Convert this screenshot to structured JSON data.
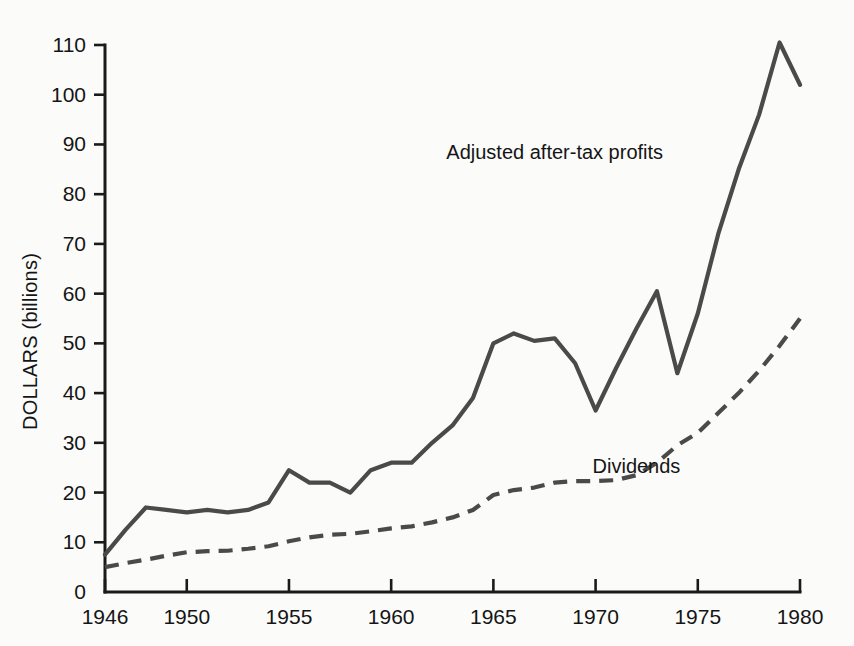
{
  "chart_data": {
    "type": "line",
    "title": "",
    "xlabel": "",
    "ylabel": "DOLLARS (billions)",
    "xlim": [
      1946,
      1980
    ],
    "ylim": [
      0,
      110
    ],
    "grid": false,
    "legend_position": "inline-annotations",
    "x_ticks": [
      "1946",
      "1950",
      "1955",
      "1960",
      "1965",
      "1970",
      "1975",
      "1980"
    ],
    "x_tick_values": [
      1946,
      1950,
      1955,
      1960,
      1965,
      1970,
      1975,
      1980
    ],
    "y_ticks": [
      "0",
      "10",
      "20",
      "30",
      "40",
      "50",
      "60",
      "70",
      "80",
      "90",
      "100",
      "110"
    ],
    "y_tick_values": [
      0,
      10,
      20,
      30,
      40,
      50,
      60,
      70,
      80,
      90,
      100,
      110
    ],
    "x": [
      1946,
      1947,
      1948,
      1949,
      1950,
      1951,
      1952,
      1953,
      1954,
      1955,
      1956,
      1957,
      1958,
      1959,
      1960,
      1961,
      1962,
      1963,
      1964,
      1965,
      1966,
      1967,
      1968,
      1969,
      1970,
      1971,
      1972,
      1973,
      1974,
      1975,
      1976,
      1977,
      1978,
      1979,
      1980
    ],
    "series": [
      {
        "name": "Adjusted after-tax profits",
        "style": "solid",
        "color": "#4a4a4a",
        "label_x": 1968,
        "label_y": 87,
        "values": [
          7.5,
          12.5,
          17,
          16.5,
          16,
          16.5,
          16,
          16.5,
          18,
          24.5,
          22,
          22,
          20,
          24.5,
          26,
          26,
          30,
          33.5,
          39,
          50,
          52,
          50.5,
          51,
          46,
          36.5,
          45,
          53,
          60.5,
          44,
          56,
          72,
          85,
          96,
          110.5,
          102
        ]
      },
      {
        "name": "Dividends",
        "style": "dashed",
        "color": "#4a4a4a",
        "label_x": 1972,
        "label_y": 24,
        "values": [
          5,
          5.8,
          6.5,
          7.3,
          8,
          8.2,
          8.3,
          8.7,
          9.2,
          10.2,
          11,
          11.5,
          11.7,
          12.2,
          12.8,
          13.2,
          14,
          15,
          16.5,
          19.5,
          20.5,
          21,
          22,
          22.3,
          22.3,
          22.5,
          23.5,
          26,
          29.5,
          32,
          36,
          40,
          44.5,
          49.5,
          55
        ]
      }
    ]
  },
  "meta": {
    "y_axis_title": "DOLLARS (billions)",
    "solid_series_label": "Adjusted after-tax profits",
    "dashed_series_label": "Dividends"
  }
}
